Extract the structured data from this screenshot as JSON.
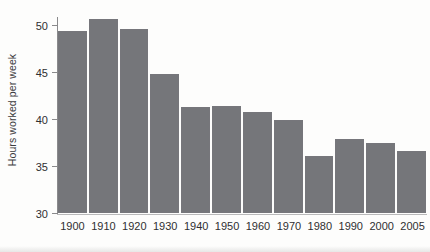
{
  "chart_data": {
    "type": "bar",
    "title": "",
    "xlabel": "",
    "ylabel": "Hours worked per week",
    "categories": [
      "1900",
      "1910",
      "1920",
      "1930",
      "1940",
      "1950",
      "1960",
      "1970",
      "1980",
      "1990",
      "2000",
      "2005"
    ],
    "values": [
      49.4,
      50.6,
      49.6,
      44.8,
      41.3,
      41.4,
      40.7,
      39.9,
      36.1,
      37.9,
      37.4,
      36.6
    ],
    "ylim": [
      30,
      51.5
    ],
    "yticks": [
      30,
      35,
      40,
      45,
      50
    ],
    "ytick_labels": [
      "30",
      "35",
      "40",
      "45",
      "50"
    ],
    "grid": false,
    "legend": null,
    "bar_color": "#75767a",
    "axis_color": "#8a8a8c",
    "text_color": "#2f2f31",
    "background": "#fdfdfc"
  }
}
